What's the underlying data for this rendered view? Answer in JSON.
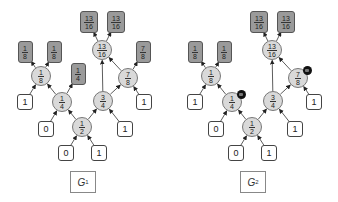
{
  "graphs": [
    {
      "id": "G1",
      "label": "G",
      "label_sub": "1",
      "offset_x": 0,
      "nodes": [
        {
          "key": "top13a",
          "type": "dark",
          "num": "13",
          "den": "16",
          "x": 89,
          "y": 22
        },
        {
          "key": "top13b",
          "type": "dark",
          "num": "13",
          "den": "16",
          "x": 116,
          "y": 22
        },
        {
          "key": "d18a",
          "type": "dark",
          "num": "1",
          "den": "8",
          "x": 25,
          "y": 52
        },
        {
          "key": "d18b",
          "type": "dark",
          "num": "1",
          "den": "8",
          "x": 54,
          "y": 52
        },
        {
          "key": "d78",
          "type": "dark",
          "num": "7",
          "den": "8",
          "x": 143,
          "y": 52
        },
        {
          "key": "c1316",
          "type": "circle",
          "num": "13",
          "den": "16",
          "x": 102,
          "y": 50
        },
        {
          "key": "c18",
          "type": "circle",
          "num": "1",
          "den": "8",
          "x": 41,
          "y": 76
        },
        {
          "key": "d14",
          "type": "dark",
          "num": "1",
          "den": "4",
          "x": 78,
          "y": 74
        },
        {
          "key": "c78",
          "type": "circle",
          "num": "7",
          "den": "8",
          "x": 128,
          "y": 78
        },
        {
          "key": "w1a",
          "type": "white",
          "value": "1",
          "x": 25,
          "y": 102
        },
        {
          "key": "c14",
          "type": "circle",
          "num": "1",
          "den": "4",
          "x": 62,
          "y": 102
        },
        {
          "key": "c34",
          "type": "circle",
          "num": "3",
          "den": "4",
          "x": 103,
          "y": 101
        },
        {
          "key": "w1b",
          "type": "white",
          "value": "1",
          "x": 144,
          "y": 102
        },
        {
          "key": "w0a",
          "type": "white",
          "value": "0",
          "x": 46,
          "y": 129
        },
        {
          "key": "c12",
          "type": "circle",
          "num": "1",
          "den": "2",
          "x": 82,
          "y": 127
        },
        {
          "key": "w1c",
          "type": "white",
          "value": "1",
          "x": 125,
          "y": 129
        },
        {
          "key": "w0b",
          "type": "white",
          "value": "0",
          "x": 66,
          "y": 153
        },
        {
          "key": "w1d",
          "type": "white",
          "value": "1",
          "x": 99,
          "y": 153
        }
      ],
      "markers": []
    },
    {
      "id": "G2",
      "label": "G",
      "label_sub": "2",
      "offset_x": 170,
      "nodes": [
        {
          "key": "top13a",
          "type": "dark",
          "num": "13",
          "den": "16",
          "x": 89,
          "y": 22
        },
        {
          "key": "top13b",
          "type": "dark",
          "num": "13",
          "den": "16",
          "x": 116,
          "y": 22
        },
        {
          "key": "d18a",
          "type": "dark",
          "num": "1",
          "den": "8",
          "x": 25,
          "y": 52
        },
        {
          "key": "d18b",
          "type": "dark",
          "num": "1",
          "den": "8",
          "x": 54,
          "y": 52
        },
        {
          "key": "c1316",
          "type": "circle",
          "num": "13",
          "den": "16",
          "x": 102,
          "y": 50
        },
        {
          "key": "c18",
          "type": "circle",
          "num": "1",
          "den": "8",
          "x": 41,
          "y": 76
        },
        {
          "key": "c78",
          "type": "circle",
          "num": "7",
          "den": "8",
          "x": 128,
          "y": 78
        },
        {
          "key": "w1a",
          "type": "white",
          "value": "1",
          "x": 25,
          "y": 102
        },
        {
          "key": "c14",
          "type": "circle",
          "num": "1",
          "den": "4",
          "x": 62,
          "y": 102
        },
        {
          "key": "c34",
          "type": "circle",
          "num": "3",
          "den": "4",
          "x": 103,
          "y": 101
        },
        {
          "key": "w1b",
          "type": "white",
          "value": "1",
          "x": 144,
          "y": 102
        },
        {
          "key": "w0a",
          "type": "white",
          "value": "0",
          "x": 46,
          "y": 129
        },
        {
          "key": "c12",
          "type": "circle",
          "num": "1",
          "den": "2",
          "x": 82,
          "y": 127
        },
        {
          "key": "w1c",
          "type": "white",
          "value": "1",
          "x": 125,
          "y": 129
        },
        {
          "key": "w0b",
          "type": "white",
          "value": "0",
          "x": 66,
          "y": 153
        },
        {
          "key": "w1d",
          "type": "white",
          "value": "1",
          "x": 99,
          "y": 153
        }
      ],
      "markers": [
        {
          "on": "c14",
          "x": 71,
          "y": 94
        },
        {
          "on": "c78",
          "x": 137,
          "y": 70
        }
      ]
    }
  ],
  "edges_g1": [
    [
      "w0b",
      "c12"
    ],
    [
      "w1d",
      "c12"
    ],
    [
      "w0a",
      "c14"
    ],
    [
      "c12",
      "c14"
    ],
    [
      "c12",
      "c34"
    ],
    [
      "w1c",
      "c34"
    ],
    [
      "w1a",
      "c18"
    ],
    [
      "c14",
      "c18"
    ],
    [
      "c14",
      "d14"
    ],
    [
      "c34",
      "c1316"
    ],
    [
      "c34",
      "c78"
    ],
    [
      "w1b",
      "c78"
    ],
    [
      "c78",
      "c1316"
    ],
    [
      "c78",
      "d78"
    ],
    [
      "c18",
      "d18a"
    ],
    [
      "c18",
      "d18b"
    ],
    [
      "c1316",
      "top13a"
    ],
    [
      "c1316",
      "top13b"
    ]
  ],
  "edges_g2": [
    [
      "w0b",
      "c12"
    ],
    [
      "w1d",
      "c12"
    ],
    [
      "w0a",
      "c14"
    ],
    [
      "c12",
      "c14"
    ],
    [
      "c12",
      "c34"
    ],
    [
      "w1c",
      "c34"
    ],
    [
      "w1a",
      "c18"
    ],
    [
      "c14",
      "c18"
    ],
    [
      "c34",
      "c1316"
    ],
    [
      "c34",
      "c78"
    ],
    [
      "w1b",
      "c78"
    ],
    [
      "c78",
      "c1316"
    ],
    [
      "c18",
      "d18a"
    ],
    [
      "c18",
      "d18b"
    ],
    [
      "c1316",
      "top13a"
    ],
    [
      "c1316",
      "top13b"
    ]
  ],
  "colors": {
    "circle_fill": "#d9d9d9",
    "dark_box_fill": "#9a9a9a",
    "white_box_fill": "#ffffff",
    "edge": "#333333",
    "marker": "#111111"
  }
}
